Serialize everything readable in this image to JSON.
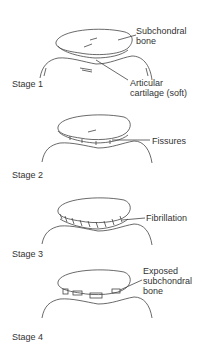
{
  "diagram": {
    "stages": [
      {
        "label": "Stage 1",
        "annotations": [
          "Subchondral bone",
          "Articular cartilage (soft)"
        ]
      },
      {
        "label": "Stage 2",
        "annotations": [
          "Fissures"
        ]
      },
      {
        "label": "Stage 3",
        "annotations": [
          "Fibrillation"
        ]
      },
      {
        "label": "Stage 4",
        "annotations": [
          "Exposed subchondral bone"
        ]
      }
    ],
    "labels": {
      "s1_bone_line1": "Subchondral",
      "s1_bone_line2": "bone",
      "s1_cart_line1": "Articular",
      "s1_cart_line2": "cartilage (soft)",
      "s2_fissures": "Fissures",
      "s3_fibrillation": "Fibrillation",
      "s4_line1": "Exposed",
      "s4_line2": "subchondral",
      "s4_line3": "bone"
    },
    "colors": {
      "line": "#444444",
      "text": "#333333",
      "background": "#ffffff"
    }
  }
}
